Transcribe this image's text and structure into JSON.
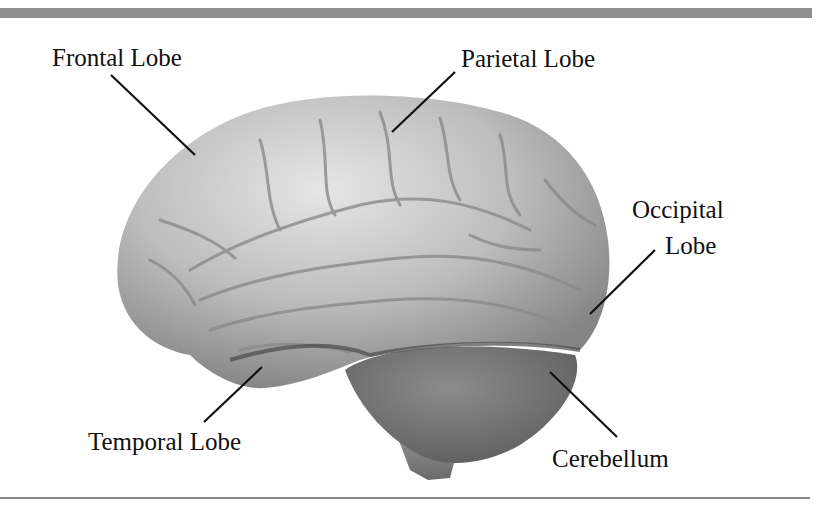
{
  "figure": {
    "labels": [
      {
        "id": "frontal",
        "text": "Frontal Lobe"
      },
      {
        "id": "parietal",
        "text": "Parietal Lobe"
      },
      {
        "id": "occipital_line1",
        "text": "Occipital"
      },
      {
        "id": "occipital_line2",
        "text": "Lobe"
      },
      {
        "id": "temporal",
        "text": "Temporal Lobe"
      },
      {
        "id": "cerebellum",
        "text": "Cerebellum"
      }
    ]
  },
  "colors": {
    "rule": "#8f8f8f",
    "brain_light": "#d9d9d9",
    "brain_mid": "#a8a8a8",
    "brain_dark": "#6f6f6f",
    "cerebellum": "#7d7d7d",
    "text": "#111111"
  }
}
